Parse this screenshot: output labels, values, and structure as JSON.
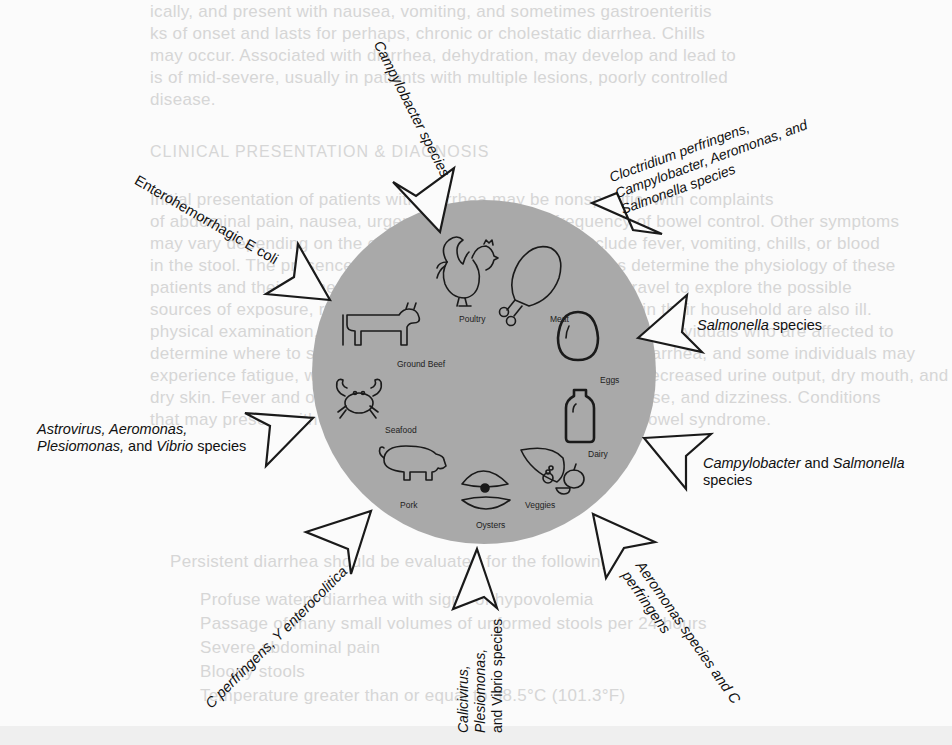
{
  "diagram": {
    "circle_color": "#a9a9a9",
    "foods": [
      {
        "id": "poultry",
        "label": "Poultry"
      },
      {
        "id": "meat",
        "label": "Meat"
      },
      {
        "id": "eggs",
        "label": "Eggs"
      },
      {
        "id": "dairy",
        "label": "Dairy"
      },
      {
        "id": "veggies",
        "label": "Veggies"
      },
      {
        "id": "oysters",
        "label": "Oysters"
      },
      {
        "id": "pork",
        "label": "Pork"
      },
      {
        "id": "seafood",
        "label": "Seafood"
      },
      {
        "id": "ground_beef",
        "label": "Ground Beef"
      }
    ],
    "pathogen_labels": [
      {
        "id": "campylobacter",
        "text": "Campylobacter species",
        "target": "Poultry"
      },
      {
        "id": "clostridium",
        "lines": [
          "Cloctridium perfringens,",
          "Campylobacter, Aeromonas, and",
          "Salmonella species"
        ],
        "target": "Meat"
      },
      {
        "id": "salmonella",
        "italic": "Salmonella",
        "rest": " species",
        "target": "Eggs"
      },
      {
        "id": "campy_salmonella",
        "italic1": "Campylobacter",
        "mid": " and ",
        "italic2": "Salmonella",
        "line2": "species",
        "target": "Dairy"
      },
      {
        "id": "aeromonas_c",
        "lines": [
          "Aeromonas species and C",
          "perfringens"
        ],
        "target": "Veggies"
      },
      {
        "id": "calicivirus",
        "lines": [
          "Calicivirus,",
          "Plesiomonas,",
          "and Vibrio species"
        ],
        "italic_words": [
          "Calicivirus",
          "Plesiomonas",
          "Vibrio"
        ],
        "target": "Oysters"
      },
      {
        "id": "c_perfringens",
        "text": "C perfringens, Y enterocolitica",
        "target": "Pork"
      },
      {
        "id": "astrovirus",
        "line1": "Astrovirus, Aeromonas,",
        "line2_italic": "Plesiomonas,",
        "line2_mid": " and ",
        "line2_italic2": "Vibrio",
        "line2_rest": " species",
        "target": "Seafood"
      },
      {
        "id": "ehec",
        "text": "Enterohemorrhagic E coli",
        "target": "Ground Beef"
      }
    ]
  },
  "bleed_through_text": [
    "ically, and present with nausea, vomiting, and sometimes gastroenteritis",
    "ks of onset and lasts for perhaps, chronic or cholestatic diarrhea. Chills",
    "may occur. Associated with diarrhea, dehydration, may develop and lead to",
    "is of mid-severe, usually in patients with multiple lesions, poorly controlled",
    "disease.",
    "CLINICAL PRESENTATION & DIAGNOSIS",
    "Initial presentation of patients with diarrhea may be nonspecific, with complaints",
    "of abdominal pain, nausea, urgency, and increased frequency of bowel control. Other symptoms",
    "may vary depending on the cause of diarrhea and may include fever, vomiting, chills, or blood",
    "in the stool. The presence or absence of these findings helps determine the physiology of these",
    "patients and their further workup. It is important to ask about travel to explore the possible",
    "sources of exposure, recent antibiotic use, and whether others in their household are also ill.",
    "physical examination, recent diet, and recent exposures to other individuals who are affected to",
    "determine where to start. The patient may report symptoms of diarrhea, and some individuals may",
    "experience fatigue, weakness, and dehydration symptoms like decreased urine output, dry mouth, and",
    "dry skin. Fever and other systemic signs suggest a bacterial cause, and dizziness. Conditions",
    "that may present with similar findings include IBD and irritable bowel syndrome.",
    "Persistent diarrhea should be evaluated for the following:",
    "Profuse watery diarrhea with signs of hypovolemia",
    "Passage of many small volumes of unformed stools per 24 hours",
    "Severe abdominal pain",
    "Bloody stools",
    "Temperature greater than or equal to 38.5°C (101.3°F)"
  ]
}
